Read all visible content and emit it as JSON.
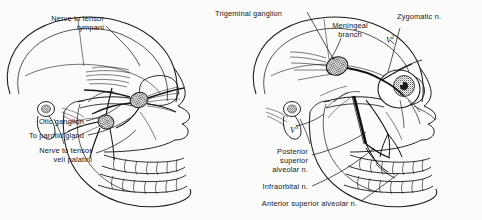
{
  "figure": {
    "background_color": "#fbfbfa",
    "ink_color": "#17171a"
  },
  "panels": [
    {
      "id": "left-panel",
      "name": "otic-ganglion-panel",
      "description": "Lateral view of skull showing otic ganglion and lesser petrosal pathway",
      "labels": [
        {
          "id": "nerve-to-tensor-tympani",
          "lines": [
            "Nerve to tensor",
            "tympani"
          ],
          "align": "right",
          "x": 22,
          "y": 14,
          "width": 82
        },
        {
          "id": "otic-ganglion",
          "lines": [
            "Otic ganglion"
          ],
          "align": "right",
          "x": 12,
          "y": 117,
          "width": 72
        },
        {
          "id": "to-parotid-gland",
          "lines": [
            "To parotid gland"
          ],
          "align": "right",
          "x": 6,
          "y": 131,
          "width": 78
        },
        {
          "id": "nerve-to-tensor-veli-palatini",
          "lines": [
            "Nerve to tensor",
            "veli palatini"
          ],
          "align": "right",
          "x": 14,
          "y": 146,
          "width": 78
        }
      ]
    },
    {
      "id": "right-panel",
      "name": "maxillary-nerve-panel",
      "description": "Lateral view of skull showing trigeminal ganglion and maxillary division branches",
      "labels": [
        {
          "id": "trigeminal-ganglion",
          "lines": [
            "Trigeminal ganglion"
          ],
          "align": "left",
          "x": 215,
          "y": 9,
          "width": 90
        },
        {
          "id": "meningeal-branch",
          "lines": [
            "Meningeal",
            "branch"
          ],
          "align": "center",
          "x": 325,
          "y": 21,
          "width": 50
        },
        {
          "id": "zygomatic-nerve",
          "lines": [
            "Zygomatic n."
          ],
          "align": "left",
          "x": 397,
          "y": 12,
          "width": 62
        },
        {
          "id": "posterior-superior-alveolar-nerve",
          "lines": [
            "Posterior",
            "superior",
            "alveolar n."
          ],
          "align": "right",
          "x": 258,
          "y": 147,
          "width": 50
        },
        {
          "id": "infraorbital-nerve",
          "lines": [
            "Infraorbital n."
          ],
          "align": "right",
          "x": 247,
          "y": 182,
          "width": 61
        },
        {
          "id": "anterior-superior-alveolar-nerve",
          "lines": [
            "Anterior superior alveolar n."
          ],
          "align": "right",
          "x": 231,
          "y": 199,
          "width": 126
        }
      ],
      "division_markers": [
        {
          "id": "v2-marker",
          "letter": "V",
          "superscript": "2",
          "x": 386,
          "y": 34
        },
        {
          "id": "v3-marker",
          "letter": "V",
          "superscript": "3",
          "x": 290,
          "y": 124
        }
      ]
    }
  ]
}
